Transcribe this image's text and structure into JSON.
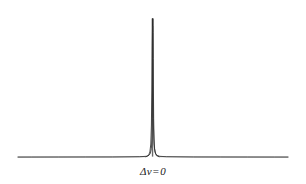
{
  "figure": {
    "background_color": "#ffffff",
    "line_color": "#2b2b2b",
    "baseline_color": "#9a9a9a"
  },
  "axis_label": {
    "full_text": "Δν = 0",
    "delta": "Δ",
    "nu": "ν",
    "equals": "=",
    "value": "0"
  },
  "chart_data": {
    "type": "line",
    "title": "",
    "subtitle": "",
    "xlabel": "Δν = 0",
    "ylabel": "",
    "grid": false,
    "legend": null,
    "annotations": [
      {
        "text": "Δν = 0",
        "x": 0,
        "position": "below-axis-center",
        "description": "frequency detuning origin label"
      }
    ],
    "axis_ranges": {
      "xlim": [
        -1,
        1
      ],
      "ylim": [
        0,
        1.05
      ]
    },
    "tick_labels": {
      "x": [],
      "y": []
    },
    "series": [
      {
        "name": "spectral lineshape",
        "color": "#2b2b2b",
        "description": "Extremely narrow Lorentzian-like emission line centered at zero detuning with flat wings",
        "peak_center_x": 0,
        "peak_height": 1.0,
        "baseline_y": 0.0,
        "x": [
          -1.0,
          -0.9,
          -0.8,
          -0.7,
          -0.6,
          -0.5,
          -0.4,
          -0.3,
          -0.2,
          -0.1,
          -0.05,
          -0.03,
          -0.02,
          -0.012,
          -0.008,
          -0.005,
          -0.003,
          -0.002,
          -0.001,
          0.0,
          0.001,
          0.002,
          0.003,
          0.005,
          0.008,
          0.012,
          0.02,
          0.03,
          0.05,
          0.1,
          0.2,
          0.3,
          0.4,
          0.5,
          0.6,
          0.7,
          0.8,
          0.9,
          1.0
        ],
        "values": [
          0.0,
          0.0,
          0.0,
          0.0,
          0.0,
          0.0,
          0.0,
          0.0,
          0.001,
          0.002,
          0.005,
          0.012,
          0.025,
          0.06,
          0.13,
          0.28,
          0.52,
          0.71,
          0.9,
          1.0,
          0.9,
          0.71,
          0.52,
          0.28,
          0.13,
          0.06,
          0.025,
          0.012,
          0.005,
          0.002,
          0.001,
          0.0,
          0.0,
          0.0,
          0.0,
          0.0,
          0.0,
          0.0,
          0.0
        ]
      }
    ]
  }
}
